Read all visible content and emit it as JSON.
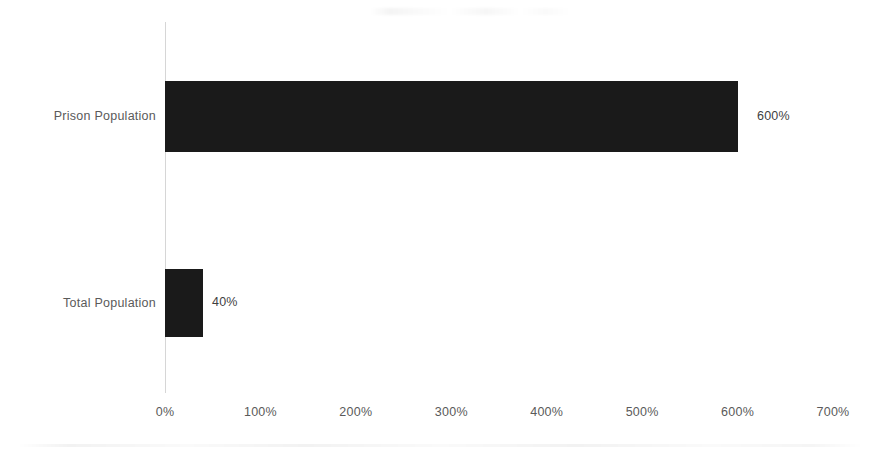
{
  "chart_data": {
    "type": "bar",
    "orientation": "horizontal",
    "title": "",
    "subtitle": "",
    "xlabel": "",
    "ylabel": "",
    "categories": [
      "Prison Population",
      "Total Population"
    ],
    "values": [
      600,
      40
    ],
    "value_labels": [
      "600%",
      "40%"
    ],
    "value_suffix": "%",
    "xlim": [
      0,
      700
    ],
    "x_tick_values": [
      0,
      100,
      200,
      300,
      400,
      500,
      600,
      700
    ],
    "x_tick_labels": [
      "0%",
      "100%",
      "200%",
      "300%",
      "400%",
      "500%",
      "600%",
      "700%"
    ],
    "grid": false,
    "legend": false,
    "legend_position": "none",
    "series": [
      {
        "name": "Percent change",
        "values": [
          600,
          40
        ],
        "color": "#1a1a1a"
      }
    ],
    "bars": [
      {
        "category": "Prison Population",
        "value": 600,
        "label": "600%"
      },
      {
        "category": "Total Population",
        "value": 40,
        "label": "40%"
      }
    ]
  },
  "style": {
    "background": "#ffffff",
    "bar_color": "#1a1a1a",
    "axis_line_color": "#d6d6d6",
    "tick_label_color": "#5a5a5a",
    "data_label_color": "#3f3f3f"
  }
}
